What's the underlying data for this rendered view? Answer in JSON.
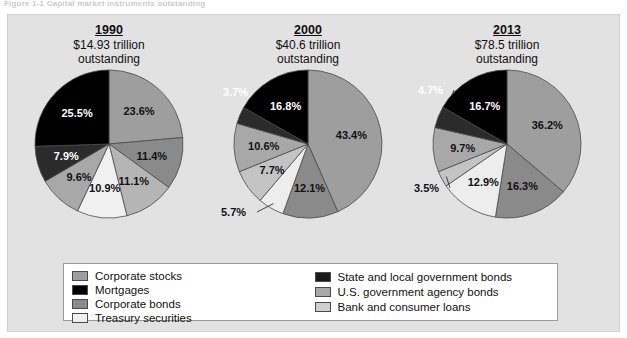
{
  "figure": {
    "title": "Figure 1-1    Capital market instruments outstanding",
    "panel_bg": "#e2e2e2"
  },
  "legend": {
    "left_items": [
      {
        "label": "Corporate stocks",
        "color": "#9e9e9e"
      },
      {
        "label": "Mortgages",
        "color": "#000000"
      },
      {
        "label": "Corporate bonds",
        "color": "#8c8c8c"
      },
      {
        "label": "Treasury securities",
        "color": "#f0f0f0"
      }
    ],
    "right_items": [
      {
        "label": "State and local government bonds",
        "color": "#1a1a1a"
      },
      {
        "label": "U.S. government agency bonds",
        "color": "#a8a8a8"
      },
      {
        "label": "Bank and consumer loans",
        "color": "#cfcfcf"
      }
    ]
  },
  "chart_data": {
    "type": "pie",
    "title": "Capital market instruments outstanding",
    "legend_position": "bottom",
    "charts": [
      {
        "year": "1990",
        "amount": "$14.93 trillion",
        "sub": "outstanding",
        "categories": [
          "Corporate stocks",
          "Corporate bonds",
          "U.S. government agency bonds",
          "Treasury securities",
          "Bank and consumer loans",
          "State and local government bonds",
          "Mortgages"
        ],
        "values": [
          23.6,
          11.4,
          11.1,
          10.9,
          9.6,
          7.9,
          25.5
        ],
        "labels": [
          "23.6%",
          "11.4%",
          "11.1%",
          "10.9%",
          "9.6%",
          "7.9%",
          "25.5%"
        ],
        "colors": [
          "#9e9e9e",
          "#8a8a8a",
          "#b5b5b5",
          "#f0f0f0",
          "#a8a8a8",
          "#2b2b2b",
          "#000000"
        ]
      },
      {
        "year": "2000",
        "amount": "$40.6 trillion",
        "sub": "outstanding",
        "categories": [
          "Corporate stocks",
          "Corporate bonds",
          "Treasury securities",
          "U.S. government agency bonds",
          "Bank and consumer loans",
          "State and local government bonds",
          "Mortgages"
        ],
        "values": [
          43.4,
          12.1,
          5.7,
          7.7,
          10.6,
          3.7,
          16.8
        ],
        "labels": [
          "43.4%",
          "12.1%",
          "5.7%",
          "7.7%",
          "10.6%",
          "3.7%",
          "16.8%"
        ],
        "colors": [
          "#9e9e9e",
          "#8a8a8a",
          "#ededed",
          "#c4c4c4",
          "#a8a8a8",
          "#2b2b2b",
          "#000000"
        ]
      },
      {
        "year": "2013",
        "amount": "$78.5 trillion",
        "sub": "outstanding",
        "categories": [
          "Corporate stocks",
          "Corporate bonds",
          "Treasury securities",
          "U.S. government agency bonds",
          "Bank and consumer loans",
          "State and local government bonds",
          "Mortgages"
        ],
        "values": [
          36.2,
          16.3,
          12.9,
          3.5,
          9.7,
          4.7,
          16.7
        ],
        "labels": [
          "36.2%",
          "16.3%",
          "12.9%",
          "3.5%",
          "9.7%",
          "4.7%",
          "16.7%"
        ],
        "colors": [
          "#9e9e9e",
          "#8a8a8a",
          "#ededed",
          "#c4c4c4",
          "#a8a8a8",
          "#2b2b2b",
          "#000000"
        ]
      }
    ]
  }
}
